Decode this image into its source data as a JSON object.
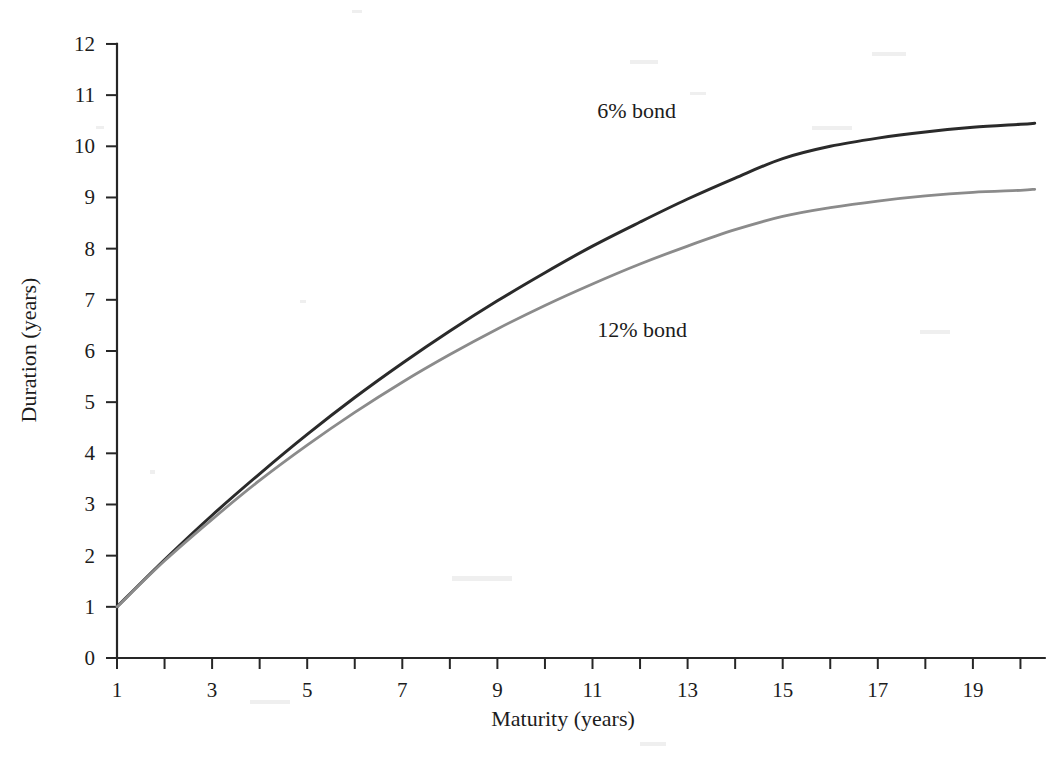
{
  "chart_data": {
    "type": "line",
    "title": "",
    "xlabel": "Maturity (years)",
    "ylabel": "Duration (years)",
    "xlim": [
      1,
      20.3
    ],
    "ylim": [
      0,
      12
    ],
    "xticks": [
      1,
      2,
      3,
      4,
      5,
      6,
      7,
      8,
      9,
      10,
      11,
      12,
      13,
      14,
      15,
      16,
      17,
      18,
      19,
      20
    ],
    "xticklabels": [
      "1",
      "",
      "3",
      "",
      "5",
      "",
      "7",
      "",
      "9",
      "",
      "11",
      "",
      "13",
      "",
      "15",
      "",
      "17",
      "",
      "19",
      ""
    ],
    "yticks": [
      0,
      1,
      2,
      3,
      4,
      5,
      6,
      7,
      8,
      9,
      10,
      11,
      12
    ],
    "yticklabels": [
      "0",
      "1",
      "2",
      "3",
      "4",
      "5",
      "6",
      "7",
      "8",
      "9",
      "10",
      "11",
      "12"
    ],
    "grid": false,
    "legend_position": "inline-annotation",
    "x": [
      1,
      2,
      3,
      4,
      5,
      6,
      7,
      8,
      9,
      10,
      11,
      12,
      13,
      14,
      15,
      16,
      17,
      18,
      19,
      20,
      20.3
    ],
    "series": [
      {
        "name": "6% bond",
        "color": "#2a2a2a",
        "annotation": "6% bond",
        "annotation_x": 11.1,
        "annotation_y": 10.55,
        "values": [
          1.0,
          1.92,
          2.79,
          3.6,
          4.37,
          5.09,
          5.76,
          6.39,
          6.98,
          7.53,
          8.05,
          8.52,
          8.97,
          9.38,
          9.76,
          10.0,
          10.16,
          10.28,
          10.37,
          10.43,
          10.45
        ]
      },
      {
        "name": "12% bond",
        "color": "#8b8b8b",
        "annotation": "12% bond",
        "annotation_x": 11.1,
        "annotation_y": 6.28,
        "values": [
          1.0,
          1.9,
          2.71,
          3.47,
          4.16,
          4.8,
          5.39,
          5.93,
          6.43,
          6.89,
          7.31,
          7.7,
          8.05,
          8.37,
          8.63,
          8.8,
          8.93,
          9.03,
          9.1,
          9.14,
          9.16
        ]
      }
    ]
  },
  "figure": {
    "background_color": "#ffffff",
    "axis_color": "#262626",
    "text_color": "#1c1c1c"
  }
}
